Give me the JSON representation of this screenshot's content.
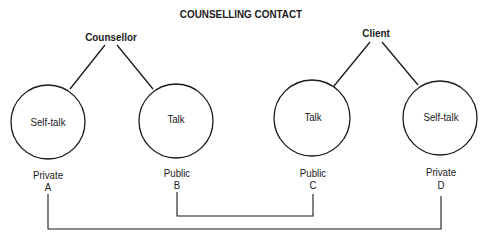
{
  "title": "COUNSELLING CONTACT",
  "parties": [
    {
      "name": "Counsellor"
    },
    {
      "name": "Client"
    }
  ],
  "nodes": [
    {
      "label": "Self-talk",
      "type": "Private",
      "letter": "A"
    },
    {
      "label": "Talk",
      "type": "Public",
      "letter": "B"
    },
    {
      "label": "Talk",
      "type": "Public",
      "letter": "C"
    },
    {
      "label": "Self-talk",
      "type": "Private",
      "letter": "D"
    }
  ],
  "connections": [
    {
      "from": "B",
      "to": "C"
    },
    {
      "from": "A",
      "to": "D"
    }
  ],
  "colors": {
    "stroke": "#1a1a1a",
    "background": "#ffffff"
  }
}
